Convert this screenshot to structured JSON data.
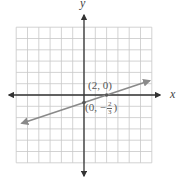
{
  "chart_data": {
    "type": "line",
    "title": "",
    "xlabel": "x",
    "ylabel": "y",
    "xlim": [
      -6,
      6
    ],
    "ylim": [
      -6,
      6
    ],
    "grid": true,
    "grid_step": 1,
    "series": [
      {
        "name": "line",
        "equation": "y = (1/3)x - 2/3",
        "slope": 0.3333,
        "intercept": -0.6667,
        "x": [
          -5.5,
          5.8
        ],
        "y": [
          -2.5,
          1.27
        ],
        "arrows": "both",
        "color": "#888888"
      }
    ],
    "points": [
      {
        "x": 2,
        "y": 0,
        "label": "(2, 0)"
      },
      {
        "x": 0,
        "y": -0.6667,
        "label_prefix": "(0, −",
        "label_num": "2",
        "label_den": "3",
        "label_suffix": ")"
      }
    ],
    "annotations": [
      "(2, 0)",
      "(0, −2/3)"
    ]
  },
  "labels": {
    "x_axis": "x",
    "y_axis": "y",
    "point_a": "(2, 0)",
    "point_b_prefix": "(0, −",
    "point_b_num": "2",
    "point_b_den": "3",
    "point_b_suffix": ")"
  },
  "colors": {
    "grid": "#c8c8c8",
    "axis": "#333333",
    "line": "#8a8a8a",
    "point": "#555555"
  }
}
